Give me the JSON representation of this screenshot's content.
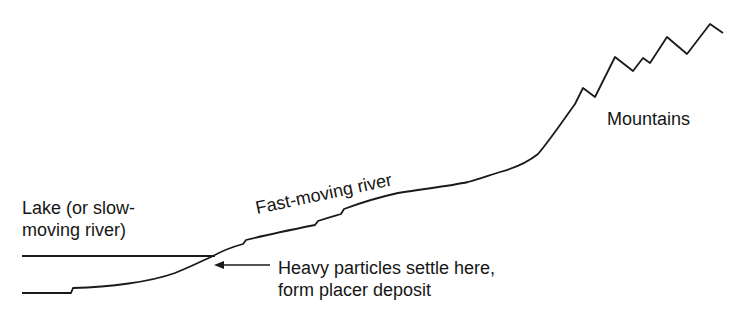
{
  "diagram": {
    "labels": {
      "lake_line1": "Lake (or slow-",
      "lake_line2": "moving river)",
      "fast_river": "Fast-moving river",
      "mountains": "Mountains",
      "deposit_line1": "Heavy particles settle here,",
      "deposit_line2": "form placer deposit"
    },
    "icons": {
      "arrow": "arrow-left-icon"
    },
    "colors": {
      "stroke": "#1a1a1a",
      "background": "#ffffff"
    }
  }
}
